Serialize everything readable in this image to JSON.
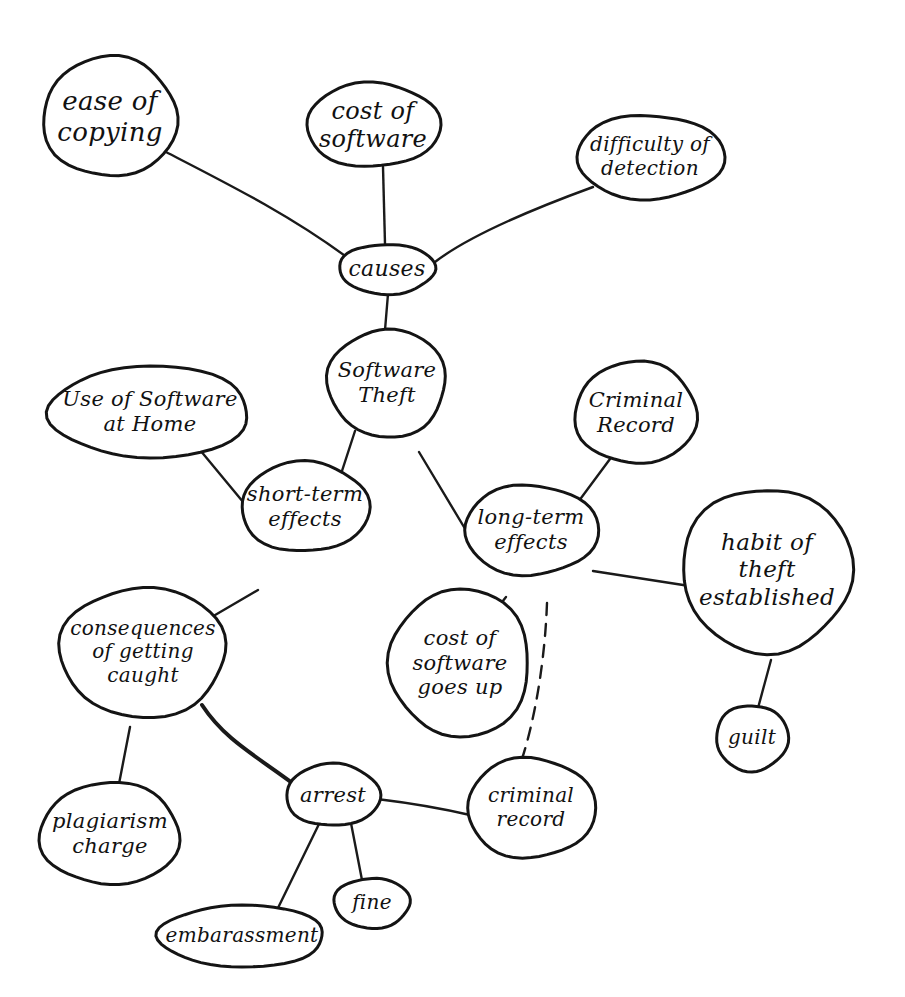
{
  "diagram": {
    "type": "concept-map",
    "background": "#ffffff",
    "ink_color": "#141414",
    "central_topic": "Software Theft",
    "nodes": [
      {
        "id": "ease_of_copying",
        "label": "ease of\ncopying",
        "cx": 110,
        "cy": 117,
        "rx": 67,
        "ry": 60,
        "font": 26
      },
      {
        "id": "cost_of_software",
        "label": "cost of\nsoftware",
        "cx": 373,
        "cy": 125,
        "rx": 67,
        "ry": 42,
        "font": 24
      },
      {
        "id": "difficulty_of_detection",
        "label": "difficulty of\ndetection",
        "cx": 650,
        "cy": 157,
        "rx": 74,
        "ry": 42,
        "font": 20
      },
      {
        "id": "causes",
        "label": "causes",
        "cx": 387,
        "cy": 269,
        "rx": 48,
        "ry": 25,
        "font": 22
      },
      {
        "id": "software_theft",
        "label": "Software\nTheft",
        "cx": 387,
        "cy": 383,
        "rx": 59,
        "ry": 54,
        "font": 21
      },
      {
        "id": "use_of_software_at_home",
        "label": "Use of Software\nat Home",
        "cx": 150,
        "cy": 412,
        "rx": 100,
        "ry": 46,
        "font": 21
      },
      {
        "id": "criminal_record_upper",
        "label": "Criminal\nRecord",
        "cx": 636,
        "cy": 413,
        "rx": 61,
        "ry": 51,
        "font": 21
      },
      {
        "id": "short_term_effects",
        "label": "short-term\neffects",
        "cx": 305,
        "cy": 507,
        "rx": 64,
        "ry": 45,
        "font": 21
      },
      {
        "id": "long_term_effects",
        "label": "long-term\neffects",
        "cx": 531,
        "cy": 530,
        "rx": 67,
        "ry": 45,
        "font": 21
      },
      {
        "id": "habit_of_theft_established",
        "label": "habit of\ntheft\nestablished",
        "cx": 767,
        "cy": 570,
        "rx": 85,
        "ry": 82,
        "font": 23
      },
      {
        "id": "consequences_of_getting_caught",
        "label": "consequences\nof getting\ncaught",
        "cx": 143,
        "cy": 652,
        "rx": 83,
        "ry": 65,
        "font": 20
      },
      {
        "id": "cost_of_software_goes_up",
        "label": "cost of\nsoftware\ngoes up",
        "cx": 460,
        "cy": 663,
        "rx": 70,
        "ry": 74,
        "font": 21
      },
      {
        "id": "plagiarism_charge",
        "label": "plagiarism\ncharge",
        "cx": 110,
        "cy": 834,
        "rx": 70,
        "ry": 51,
        "font": 21
      },
      {
        "id": "arrest",
        "label": "arrest",
        "cx": 333,
        "cy": 795,
        "rx": 47,
        "ry": 31,
        "font": 21
      },
      {
        "id": "criminal_record_lower",
        "label": "criminal\nrecord",
        "cx": 531,
        "cy": 808,
        "rx": 64,
        "ry": 50,
        "font": 20
      },
      {
        "id": "guilt",
        "label": "guilt",
        "cx": 752,
        "cy": 738,
        "rx": 36,
        "ry": 33,
        "font": 20
      },
      {
        "id": "fine",
        "label": "fine",
        "cx": 372,
        "cy": 903,
        "rx": 38,
        "ry": 25,
        "font": 20
      },
      {
        "id": "embarassment",
        "label": "embarassment",
        "cx": 242,
        "cy": 936,
        "rx": 83,
        "ry": 31,
        "font": 20
      }
    ],
    "edges": [
      {
        "from": "ease_of_copying",
        "to": "causes",
        "style": "solid",
        "path": "M166,152 C230,185 290,215 348,258"
      },
      {
        "from": "cost_of_software",
        "to": "causes",
        "style": "solid",
        "path": "M383,167 L385,244"
      },
      {
        "from": "difficulty_of_detection",
        "to": "causes",
        "style": "solid",
        "path": "M593,187 C530,210 470,235 435,262"
      },
      {
        "from": "causes",
        "to": "software_theft",
        "style": "solid",
        "path": "M388,294 L385,330"
      },
      {
        "from": "use_of_software_at_home",
        "to": "short_term_effects",
        "style": "solid",
        "path": "M200,450 L258,520"
      },
      {
        "from": "software_theft",
        "to": "short_term_effects",
        "style": "solid",
        "path": "M355,431 L327,517"
      },
      {
        "from": "software_theft",
        "to": "long_term_effects",
        "style": "solid",
        "path": "M419,452 L470,537"
      },
      {
        "from": "criminal_record_upper",
        "to": "long_term_effects",
        "style": "solid",
        "path": "M610,459 L564,521"
      },
      {
        "from": "long_term_effects",
        "to": "habit_of_theft_established",
        "style": "solid",
        "path": "M593,571 L696,587"
      },
      {
        "from": "long_term_effects",
        "to": "cost_of_software_goes_up",
        "style": "solid",
        "path": "M506,597 L488,620"
      },
      {
        "from": "long_term_effects",
        "to": "criminal_record_lower",
        "style": "dashed",
        "path": "M547,603 C545,660 535,720 521,762"
      },
      {
        "from": "short_term_effects",
        "to": "consequences_of_getting_caught",
        "style": "solid",
        "path": "M258,590 L210,618"
      },
      {
        "from": "consequences_of_getting_caught",
        "to": "plagiarism_charge",
        "style": "solid",
        "path": "M130,727 L118,789"
      },
      {
        "from": "consequences_of_getting_caught",
        "to": "arrest",
        "style": "thick",
        "path": "M202,705 C225,740 255,755 295,785"
      },
      {
        "from": "arrest",
        "to": "criminal_record_lower",
        "style": "solid",
        "path": "M377,799 C410,803 440,808 470,815"
      },
      {
        "from": "arrest",
        "to": "embarassment",
        "style": "solid",
        "path": "M320,822 L276,912"
      },
      {
        "from": "arrest",
        "to": "fine",
        "style": "solid",
        "path": "M350,818 L362,880"
      },
      {
        "from": "habit_of_theft_established",
        "to": "guilt",
        "style": "solid",
        "path": "M771,660 L758,708"
      }
    ]
  }
}
